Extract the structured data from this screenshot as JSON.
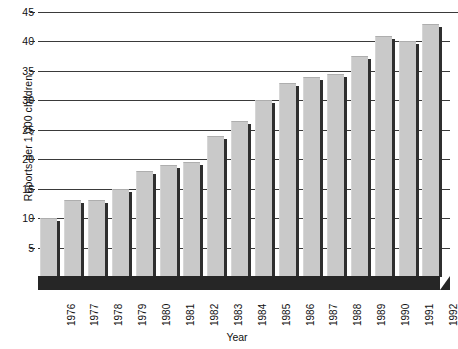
{
  "chart_data": {
    "type": "bar",
    "title": "",
    "xlabel": "Year",
    "ylabel": "Reports per 1,000 children",
    "categories": [
      "1976",
      "1977",
      "1978",
      "1979",
      "1980",
      "1981",
      "1982",
      "1983",
      "1984",
      "1985",
      "1986",
      "1987",
      "1988",
      "1989",
      "1990",
      "1991",
      "1992"
    ],
    "values": [
      10,
      13,
      13,
      15,
      18,
      19,
      19.5,
      24,
      26.5,
      30,
      33,
      34,
      34.5,
      37.5,
      41,
      40,
      43
    ],
    "series": [
      {
        "name": "Reports per 1,000 children",
        "values": [
          10,
          13,
          13,
          15,
          18,
          19,
          19.5,
          24,
          26.5,
          30,
          33,
          34,
          34.5,
          37.5,
          41,
          40,
          43
        ]
      }
    ],
    "ylim": [
      0,
      45
    ],
    "yticks": [
      5,
      10,
      15,
      20,
      25,
      30,
      35,
      40,
      45
    ],
    "ytick_labels": [
      "5",
      "10",
      "15",
      "20",
      "25",
      "30",
      "35",
      "40",
      "45"
    ],
    "grid": true,
    "grid_axis": "y",
    "legend": false,
    "legend_position": "none",
    "bar_color": "#c9c9c9",
    "bar_shadow_color": "#2f2f2f",
    "grid_color": "#3a3a3a",
    "baseplate_color": "#262626",
    "background_color": "#ffffff",
    "text_color": "#101010"
  }
}
